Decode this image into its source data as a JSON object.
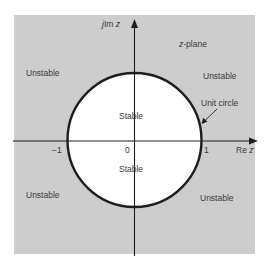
{
  "figure": {
    "title": "z-plane",
    "axes": {
      "imag_axis_label_prefix": "j",
      "imag_axis_label_main": "Im",
      "imag_axis_label_var": "z",
      "real_axis_label_main": "Re",
      "real_axis_label_var": "z"
    },
    "ticks": {
      "neg_one": "−1",
      "zero": "0",
      "one": "1"
    },
    "regions": {
      "outside_top_left": "Unstable",
      "outside_top_right": "Unstable",
      "outside_bottom_left": "Unstable",
      "outside_bottom_right": "Unstable",
      "inside_upper": "Stable",
      "inside_lower": "Stable"
    },
    "annotation": {
      "unit_circle": "Unit circle"
    },
    "plane_label_var": "z",
    "plane_label_rest": "-plane",
    "colors": {
      "outside_fill": "#cdcdcd",
      "inside_fill": "#ffffff",
      "stroke": "#1e1e1e",
      "text": "#3a3a3a"
    }
  }
}
